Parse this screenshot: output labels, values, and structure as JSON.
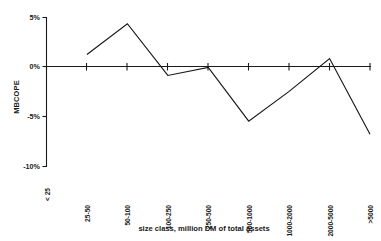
{
  "chart_data": {
    "type": "line",
    "title": "",
    "xlabel": "size class, million DM of total assets",
    "ylabel": "MBCOPE",
    "categories": [
      "< 25",
      "25-50",
      "50-100",
      "100-250",
      "250-500",
      "500-1000",
      "1000-2000",
      "2000-5000",
      ">5000"
    ],
    "values": [
      null,
      1.2,
      4.3,
      -0.9,
      -0.1,
      -5.5,
      -2.5,
      0.8,
      -6.8
    ],
    "series": [
      {
        "name": "MBCOPE",
        "values": [
          null,
          1.2,
          4.3,
          -0.9,
          -0.1,
          -5.5,
          -2.5,
          0.8,
          -6.8
        ]
      }
    ],
    "ylim": [
      -10,
      5
    ],
    "ytick_values": [
      5,
      0,
      -5,
      -10
    ],
    "ytick_labels": [
      "5%",
      "0%",
      "-5%",
      "-10%"
    ],
    "grid": false,
    "legend": "none",
    "zero_line": true,
    "units": "percent"
  },
  "axes": {
    "y_labels": [
      "5%",
      "0%",
      "-5%",
      "-10%"
    ],
    "y_title": "MBCOPE",
    "x_labels": [
      "< 25",
      "25-50",
      "50-100",
      "100-250",
      "250-500",
      "500-1000",
      "1000-2000",
      "2000-5000",
      ">5000"
    ],
    "x_title": "size class, million DM of total assets"
  }
}
